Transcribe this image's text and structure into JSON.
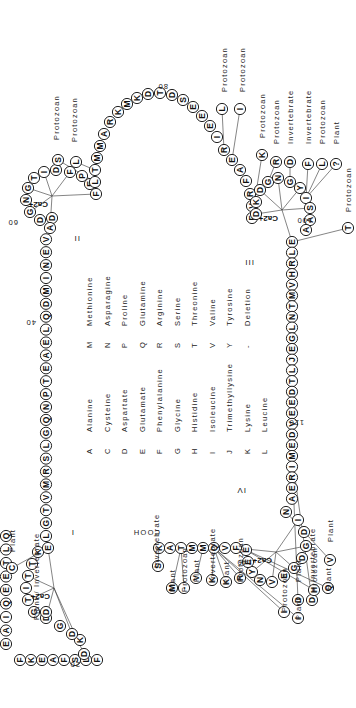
{
  "domains": [
    "I",
    "II",
    "III",
    "IV"
  ],
  "ion_label": "Ca2+",
  "terminus_label": "COOH",
  "position_numbers": [
    "20",
    "40",
    "60",
    "80",
    "100",
    "120",
    "140"
  ],
  "sequence": {
    "segment_start": [
      "Q",
      "L",
      "T",
      "E",
      "E",
      "Q",
      "I",
      "A",
      "E",
      "F",
      "K",
      "E",
      "A",
      "F",
      "S",
      "L",
      "F",
      "D",
      "K",
      "D",
      "G",
      "D",
      "G",
      "T",
      "I",
      "T",
      "T",
      "K",
      "E",
      "L",
      "G",
      "T",
      "V",
      "M",
      "R",
      "S",
      "L",
      "G",
      "Q",
      "N",
      "P",
      "T",
      "E",
      "A",
      "E",
      "L",
      "Q",
      "D",
      "M",
      "I",
      "N",
      "E",
      "V",
      "D",
      "A",
      "D",
      "G",
      "N",
      "G",
      "T",
      "I",
      "D",
      "F",
      "P",
      "E",
      "F",
      "L",
      "T",
      "M",
      "M",
      "A",
      "R",
      "K",
      "M",
      "K",
      "D",
      "T",
      "D",
      "S",
      "E",
      "E",
      "E",
      "I",
      "R",
      "E",
      "A",
      "F",
      "R",
      "V",
      "F",
      "D",
      "K",
      "D",
      "G",
      "N",
      "G",
      "Y",
      "I",
      "S",
      "A",
      "A",
      "E",
      "L",
      "R",
      "H",
      "V",
      "M",
      "T",
      "N",
      "L",
      "G",
      "E",
      "J",
      "L",
      "T",
      "D",
      "E",
      "E",
      "V",
      "D",
      "E",
      "M",
      "I",
      "R",
      "E",
      "A",
      "N",
      "I",
      "D",
      "G",
      "D",
      "G",
      "E",
      "V",
      "N",
      "Y",
      "E",
      "E",
      "F",
      "V",
      "Q",
      "M",
      "M",
      "T",
      "A",
      "K"
    ]
  },
  "substitutions": [
    {
      "residue": "C",
      "label": "Plant"
    },
    {
      "residue": "D",
      "label": "Plant / Invertebrate"
    },
    {
      "residue": "S",
      "label": "Protozoan"
    },
    {
      "residue": "L",
      "label": "Protozoan"
    },
    {
      "residue": "L",
      "label": "Protozoan"
    },
    {
      "residue": "I",
      "label": "Protozoan"
    },
    {
      "residue": "K",
      "label": "Protozoan"
    },
    {
      "residue": "R",
      "label": "Protozoan"
    },
    {
      "residue": "D",
      "label": "Invertebrate"
    },
    {
      "residue": "F",
      "label": "Invertebrate"
    },
    {
      "residue": "L",
      "label": "Protozoan"
    },
    {
      "residue": "?",
      "label": "Plant"
    },
    {
      "residue": "T",
      "label": "Protozoan"
    },
    {
      "residue": "D",
      "label": "Plant"
    },
    {
      "residue": "D",
      "label": "Invertebrate"
    },
    {
      "residue": "V",
      "label": "Plant"
    },
    {
      "residue": "S",
      "label": "Invertebrate"
    },
    {
      "residue": "M",
      "label": "Plant"
    },
    {
      "residue": "-",
      "label": "Protozoan"
    },
    {
      "residue": "V",
      "label": "Plant"
    },
    {
      "residue": "K",
      "label": "Invertebrate"
    },
    {
      "residue": "K",
      "label": "Plant"
    },
    {
      "residue": "R",
      "label": "Protozoan"
    },
    {
      "residue": "I",
      "label": "Protozoan"
    },
    {
      "residue": "I",
      "label": "Plant"
    },
    {
      "residue": "H",
      "label": "Protozoan"
    },
    {
      "residue": "Q",
      "label": "Plant"
    }
  ],
  "key": {
    "col1": [
      {
        "code": "A",
        "name": "Alanine"
      },
      {
        "code": "C",
        "name": "Cysteine"
      },
      {
        "code": "D",
        "name": "Aspartate"
      },
      {
        "code": "E",
        "name": "Glutamate"
      },
      {
        "code": "F",
        "name": "Phenylalanine"
      },
      {
        "code": "G",
        "name": "Glycine"
      },
      {
        "code": "H",
        "name": "Histidine"
      },
      {
        "code": "I",
        "name": "Isoleucine"
      },
      {
        "code": "J",
        "name": "Trimethyllysine"
      },
      {
        "code": "K",
        "name": "Lysine"
      },
      {
        "code": "L",
        "name": "Leucine"
      }
    ],
    "col2": [
      {
        "code": "M",
        "name": "Methionine"
      },
      {
        "code": "N",
        "name": "Asparagine"
      },
      {
        "code": "P",
        "name": "Proline"
      },
      {
        "code": "Q",
        "name": "Glutamine"
      },
      {
        "code": "R",
        "name": "Arginine"
      },
      {
        "code": "S",
        "name": "Serine"
      },
      {
        "code": "T",
        "name": "Threonine"
      },
      {
        "code": "V",
        "name": "Valine"
      },
      {
        "code": "Y",
        "name": "Tyrosine"
      },
      {
        "code": "-",
        "name": "Deletion"
      }
    ]
  }
}
